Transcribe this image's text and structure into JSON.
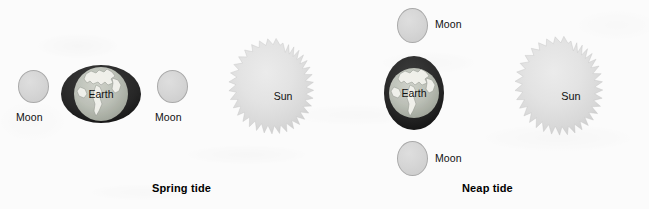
{
  "diagram": {
    "background_color": "#fbfbfb",
    "moon_color": "#d5d5d5",
    "sun_color": "#e2e2e2",
    "earth_bulge_color": "#2a2a2a",
    "earth_color": "#b9bdb4",
    "text_color": "#111111"
  },
  "panels": [
    {
      "id": "spring",
      "caption": "Spring tide",
      "bodies": [
        {
          "name": "Moon",
          "label": "Moon",
          "type": "moon"
        },
        {
          "name": "Earth",
          "label": "Earth",
          "type": "earth",
          "bulge": "horizontal"
        },
        {
          "name": "Moon",
          "label": "Moon",
          "type": "moon"
        },
        {
          "name": "Sun",
          "label": "Sun",
          "type": "sun"
        }
      ]
    },
    {
      "id": "neap",
      "caption": "Neap tide",
      "bodies": [
        {
          "name": "Moon",
          "label": "Moon",
          "type": "moon"
        },
        {
          "name": "Earth",
          "label": "Earth",
          "type": "earth",
          "bulge": "vertical"
        },
        {
          "name": "Moon",
          "label": "Moon",
          "type": "moon"
        },
        {
          "name": "Sun",
          "label": "Sun",
          "type": "sun"
        }
      ]
    }
  ],
  "labels": {
    "moon": "Moon",
    "earth": "Earth",
    "sun": "Sun",
    "spring_tide": "Spring tide",
    "neap_tide": "Neap tide"
  }
}
